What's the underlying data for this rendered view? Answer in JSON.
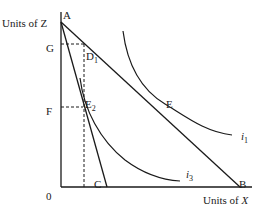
{
  "diagram": {
    "axes": {
      "y_label": "Units of Z",
      "x_label_prefix": "Units of ",
      "x_label_var": "X",
      "origin": "0"
    },
    "points": {
      "A": "A",
      "B": "B",
      "C": "C",
      "E": "E",
      "G": "G",
      "F": "F",
      "D1": "D",
      "D1_sub": "1",
      "E2": "E",
      "E2_sub": "2"
    },
    "curves": {
      "i1": "i",
      "i1_sub": "1",
      "i3": "i",
      "i3_sub": "3"
    },
    "colors": {
      "line": "#1a1a1a",
      "background": "#ffffff"
    }
  }
}
